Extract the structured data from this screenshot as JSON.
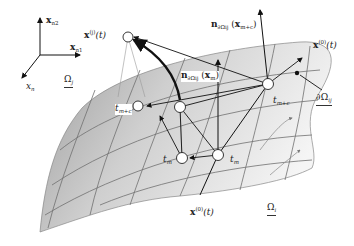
{
  "diagram": {
    "type": "geometric-illustration",
    "axes": {
      "x_n2": {
        "base": "x",
        "sub": "n",
        "subsub": "2"
      },
      "x_n1": {
        "base": "x",
        "sub": "n",
        "subsub": "1"
      },
      "x_n": {
        "base": "x",
        "sub": "n"
      }
    },
    "labels": {
      "omega_j": {
        "base": "Ω",
        "sub": "j"
      },
      "omega_i": {
        "base": "Ω",
        "sub": "i"
      },
      "boundary": {
        "prefix": "∂",
        "base": "Ω",
        "sub": "ij"
      },
      "x_j_t": {
        "base": "x",
        "sup": "(j)",
        "arg": "(t)"
      },
      "x_0_t_right": {
        "base": "x",
        "sup": "(0)",
        "arg": "(t)"
      },
      "x_0_t_bottom": {
        "base": "x",
        "sup": "(0)",
        "arg": "(t)"
      },
      "n_top": {
        "base": "n",
        "sub": "∂Ω",
        "subsub": "ij",
        "arg_base": "x",
        "arg_sub": "m+c"
      },
      "n_mid": {
        "base": "n",
        "sub": "∂Ω",
        "subsub": "ij",
        "arg_base": "x",
        "arg_sub": "m"
      },
      "t_m_plus_c_left": {
        "base": "t",
        "sub": "m+c"
      },
      "t_m_plus_c_right": {
        "base": "t",
        "sub": "m+c"
      },
      "t_m_left": {
        "base": "t",
        "sub": "m"
      },
      "t_m_right": {
        "base": "t",
        "sub": "m"
      }
    },
    "colors": {
      "surface_dark": "#9a9a9a",
      "surface_light": "#f2f2f2",
      "grid": "#6f6f6f",
      "ink": "#1a1a1a"
    }
  }
}
